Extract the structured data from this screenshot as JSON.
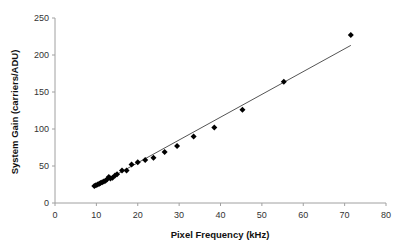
{
  "chart_data": {
    "type": "scatter",
    "title": "",
    "xlabel": "Pixel Frequency (kHz)",
    "ylabel": "System Gain (carriers/ADU)",
    "xlim": [
      0,
      80
    ],
    "ylim": [
      0,
      250
    ],
    "xticks": [
      0,
      10,
      20,
      30,
      40,
      50,
      60,
      70,
      80
    ],
    "yticks": [
      0,
      50,
      100,
      150,
      200,
      250
    ],
    "grid": false,
    "legend": null,
    "series": [
      {
        "name": "Measured",
        "marker": "diamond",
        "color": "#000000",
        "x": [
          9.5,
          9.9,
          10.3,
          10.7,
          11.0,
          11.4,
          11.8,
          12.2,
          12.6,
          13.0,
          13.4,
          13.9,
          14.5,
          15.0,
          16.2,
          17.3,
          18.5,
          20.0,
          21.8,
          23.8,
          26.5,
          29.5,
          33.5,
          38.5,
          45.3,
          55.3,
          71.5
        ],
        "y": [
          23,
          24,
          25,
          26,
          27,
          28,
          29,
          30,
          32,
          35,
          33,
          34,
          37,
          39,
          44,
          44,
          52,
          55,
          58,
          61,
          69,
          77,
          90,
          102,
          126,
          164,
          227
        ]
      },
      {
        "name": "Linear fit",
        "type": "line",
        "color": "#555555",
        "x": [
          9.5,
          71.5
        ],
        "y": [
          22,
          213
        ]
      }
    ]
  }
}
